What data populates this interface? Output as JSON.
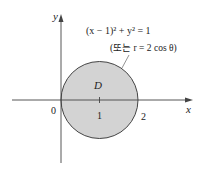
{
  "diagram": {
    "region_label": "D",
    "equation": "(x − 1)² + y² = 1",
    "equation_alt": "(또는 r = 2 cos θ)",
    "axis_x_label": "x",
    "axis_y_label": "y",
    "tick_labels": {
      "origin": "0",
      "one": "1",
      "two": "2"
    },
    "colors": {
      "fill": "#d3d3d3",
      "stroke": "#444444",
      "axis": "#444444"
    }
  }
}
